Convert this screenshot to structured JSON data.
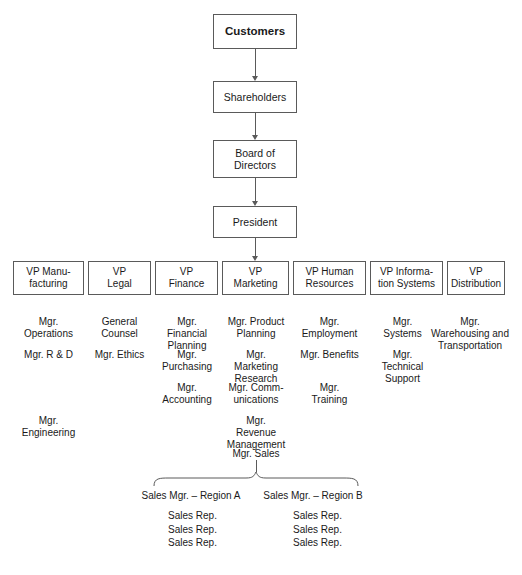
{
  "chart_title": "Organization Chart",
  "spine": {
    "nodes": [
      {
        "label": "Customers",
        "bold": true
      },
      {
        "label": "Shareholders",
        "bold": false
      },
      {
        "label": "Board of\nDirectors",
        "bold": false
      },
      {
        "label": "President",
        "bold": false
      }
    ]
  },
  "vp_row": [
    {
      "label": "VP Manu-\nfacturing",
      "managers": [
        "Mgr.\nOperations",
        "Mgr. R & D",
        "",
        "Mgr.\nEngineering"
      ]
    },
    {
      "label": "VP\nLegal",
      "managers": [
        "General\nCounsel",
        "Mgr. Ethics"
      ]
    },
    {
      "label": "VP\nFinance",
      "managers": [
        "Mgr.\nFinancial\nPlanning",
        "Mgr.\nPurchasing",
        "Mgr.\nAccounting"
      ]
    },
    {
      "label": "VP\nMarketing",
      "managers": [
        "Mgr. Product\nPlanning",
        "Mgr.\nMarketing\nResearch",
        "Mgr. Comm-\nunications",
        "Mgr.\nRevenue\nManagement",
        "Mgr. Sales"
      ]
    },
    {
      "label": "VP Human\nResources",
      "managers": [
        "Mgr.\nEmployment",
        "Mgr. Benefits",
        "Mgr.\nTraining"
      ]
    },
    {
      "label": "VP Informa-\ntion Systems",
      "managers": [
        "Mgr.\nSystems",
        "Mgr.\nTechnical\nSupport"
      ]
    },
    {
      "label": "VP\nDistribution",
      "managers": [
        "Mgr.\nWarehousing and\nTransportation"
      ]
    }
  ],
  "sales_regions": [
    {
      "label": "Sales Mgr. – Region A",
      "reps": [
        "Sales Rep.",
        "Sales Rep.",
        "Sales Rep."
      ]
    },
    {
      "label": "Sales Mgr. – Region B",
      "reps": [
        "Sales Rep.",
        "Sales Rep.",
        "Sales Rep."
      ]
    }
  ],
  "colors": {
    "box_border": "#5a5a5a",
    "text": "#1a1a1a",
    "connector": "#5a5a5a",
    "background": "#ffffff"
  }
}
